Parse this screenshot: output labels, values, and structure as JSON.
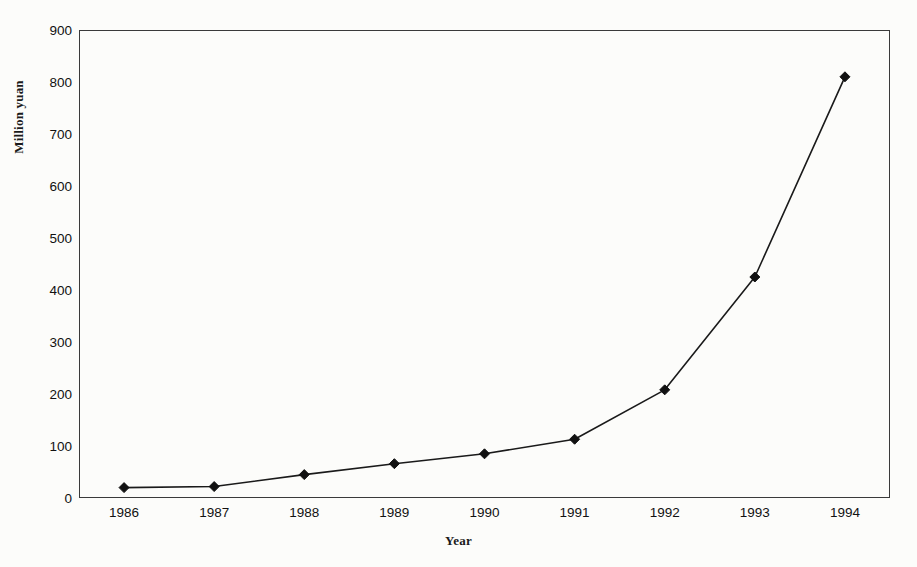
{
  "chart_data": {
    "type": "line",
    "title": "",
    "subtitle": "",
    "xlabel": "Year",
    "ylabel": "Million yuan",
    "categories": [
      "1986",
      "1987",
      "1988",
      "1989",
      "1990",
      "1991",
      "1992",
      "1993",
      "1994"
    ],
    "x": [
      1986,
      1987,
      1988,
      1989,
      1990,
      1991,
      1992,
      1993,
      1994
    ],
    "values": [
      20,
      22,
      45,
      66,
      85,
      113,
      208,
      425,
      810
    ],
    "series": [
      {
        "name": "Million yuan",
        "values": [
          20,
          22,
          45,
          66,
          85,
          113,
          208,
          425,
          810
        ]
      }
    ],
    "ylim": [
      0,
      900
    ],
    "yticks": [
      0,
      100,
      200,
      300,
      400,
      500,
      600,
      700,
      800,
      900
    ],
    "ytick_labels": [
      "0",
      "100",
      "200",
      "300",
      "400",
      "500",
      "600",
      "700",
      "800",
      "900"
    ],
    "xtick_labels": [
      "1986",
      "1987",
      "1988",
      "1989",
      "1990",
      "1991",
      "1992",
      "1993",
      "1994"
    ],
    "grid": false,
    "legend": false,
    "legend_position": "none",
    "marker": "diamond",
    "line_color": "#1a1a1a",
    "marker_color": "#111111",
    "frame_color": "#3a3a3a",
    "background_color": "#fcfcfa"
  }
}
